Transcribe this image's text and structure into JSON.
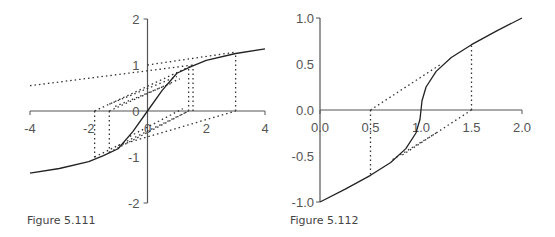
{
  "chart_data": [
    {
      "type": "line",
      "id": "fig-5-111",
      "caption": "Figure 5.111",
      "xlim": [
        -4,
        4
      ],
      "ylim": [
        -2,
        2
      ],
      "xticks": [
        -4,
        -2,
        0,
        2,
        4
      ],
      "xtick_labels": [
        "-4",
        "-2",
        "0",
        "2",
        "4"
      ],
      "yticks": [
        -2,
        -1,
        0,
        1,
        2
      ],
      "ytick_labels": [
        "-2",
        "-1",
        "0",
        "1",
        "2"
      ],
      "grid": false,
      "series": [
        {
          "name": "curve",
          "style": "solid",
          "x": [
            -4,
            -3,
            -2,
            -1.5,
            -1,
            -0.5,
            0,
            0.5,
            1,
            1.5,
            2,
            3,
            4
          ],
          "y": [
            -1.35,
            -1.25,
            -1.1,
            -0.97,
            -0.82,
            -0.45,
            0,
            0.45,
            0.82,
            0.97,
            1.1,
            1.25,
            1.35
          ]
        }
      ],
      "dotted_lines": [
        {
          "x": [
            -4,
            1.55
          ],
          "y": [
            0.55,
            1.0
          ]
        },
        {
          "x": [
            -1.8,
            1.55
          ],
          "y": [
            0,
            1.0
          ]
        },
        {
          "x": [
            -1.3,
            1.1
          ],
          "y": [
            0,
            0.7
          ]
        },
        {
          "x": [
            -1.3,
            1.0
          ],
          "y": [
            0.15,
            0.75
          ]
        },
        {
          "x": [
            -1.1,
            0.8
          ],
          "y": [
            0.1,
            0.6
          ]
        },
        {
          "x": [
            0,
            3.0
          ],
          "y": [
            1.0,
            1.28
          ]
        },
        {
          "x": [
            -1.8,
            1.4
          ],
          "y": [
            -1.0,
            0
          ]
        },
        {
          "x": [
            -1.3,
            1.4
          ],
          "y": [
            -0.9,
            0
          ]
        },
        {
          "x": [
            -1.0,
            3.0
          ],
          "y": [
            -0.75,
            0
          ]
        },
        {
          "x": [
            -0.6,
            1.2
          ],
          "y": [
            -0.55,
            0.05
          ]
        },
        {
          "x": [
            -1.8,
            -1.8
          ],
          "y": [
            0,
            -1.05
          ]
        },
        {
          "x": [
            -1.3,
            -1.3
          ],
          "y": [
            0,
            -0.95
          ]
        },
        {
          "x": [
            1.4,
            1.4
          ],
          "y": [
            0,
            0.98
          ]
        },
        {
          "x": [
            1.55,
            1.55
          ],
          "y": [
            0,
            1.0
          ]
        },
        {
          "x": [
            3.0,
            3.0
          ],
          "y": [
            0,
            1.25
          ]
        }
      ]
    },
    {
      "type": "line",
      "id": "fig-5-112",
      "caption": "Figure 5.112",
      "xlim": [
        0,
        2.0
      ],
      "ylim": [
        -1.0,
        1.0
      ],
      "xticks": [
        0,
        0.5,
        1.0,
        1.5,
        2.0
      ],
      "xtick_labels": [
        "0.0",
        "0.5",
        "1.0",
        "1.5",
        "2.0"
      ],
      "yticks": [
        -1.0,
        -0.5,
        0.0,
        0.5,
        1.0
      ],
      "ytick_labels": [
        "-1.0",
        "-0.5",
        "0.0",
        "0.5",
        "1.0"
      ],
      "grid": false,
      "series": [
        {
          "name": "curve",
          "style": "solid",
          "x": [
            0,
            0.25,
            0.5,
            0.7,
            0.85,
            0.95,
            0.99,
            1.0,
            1.01,
            1.05,
            1.15,
            1.3,
            1.5,
            1.75,
            2.0
          ],
          "y": [
            -1.0,
            -0.86,
            -0.71,
            -0.57,
            -0.42,
            -0.25,
            -0.1,
            0,
            0.1,
            0.25,
            0.42,
            0.57,
            0.71,
            0.86,
            1.0
          ]
        }
      ],
      "dotted_lines": [
        {
          "x": [
            0.5,
            1.2
          ],
          "y": [
            0.0,
            0.5
          ]
        },
        {
          "x": [
            0.5,
            0.5
          ],
          "y": [
            0.0,
            -0.71
          ]
        },
        {
          "x": [
            1.5,
            1.5
          ],
          "y": [
            0.0,
            0.71
          ]
        },
        {
          "x": [
            1.5,
            0.8
          ],
          "y": [
            0.0,
            -0.5
          ]
        },
        {
          "x": [
            1.15,
            0.7
          ],
          "y": [
            -0.25,
            -0.55
          ]
        }
      ]
    }
  ]
}
